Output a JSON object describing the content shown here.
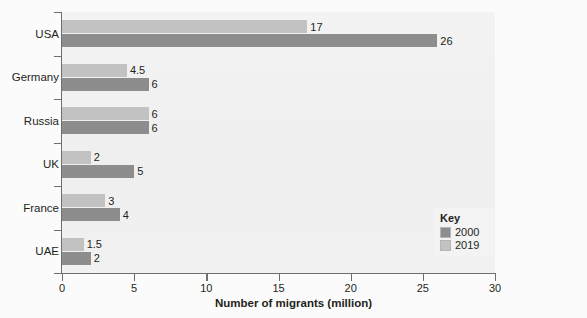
{
  "chart_data": {
    "type": "bar",
    "orientation": "horizontal",
    "title": "",
    "xlabel": "Number of migrants (million)",
    "ylabel": "",
    "xlim": [
      0,
      30
    ],
    "xticks": [
      0,
      5,
      10,
      15,
      20,
      25,
      30
    ],
    "xtick_labels": [
      "0",
      "5",
      "10",
      "15",
      "20",
      "25",
      "30"
    ],
    "grid": false,
    "categories": [
      "USA",
      "Germany",
      "Russia",
      "UK",
      "France",
      "UAE"
    ],
    "series": [
      {
        "name": "2019",
        "color": "#c2c2c2",
        "values": [
          17,
          4.5,
          6,
          2,
          3,
          1.5
        ],
        "value_labels": [
          "17",
          "4.5",
          "6",
          "2",
          "3",
          "1.5"
        ]
      },
      {
        "name": "2000",
        "color": "#8d8d8d",
        "values": [
          26,
          6,
          6,
          5,
          4,
          2
        ],
        "value_labels": [
          "26",
          "6",
          "6",
          "5",
          "4",
          "2"
        ]
      }
    ],
    "legend": {
      "position": "bottom-right",
      "title": "Key",
      "entries": [
        {
          "label": "2000",
          "color": "#8d8d8d"
        },
        {
          "label": "2019",
          "color": "#c2c2c2"
        }
      ]
    }
  }
}
